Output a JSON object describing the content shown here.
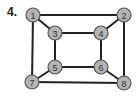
{
  "problem": {
    "label": "4."
  },
  "graph": {
    "node_radius": 7,
    "colors": {
      "node_fill": "#b4b4b4",
      "node_stroke": "#555555",
      "edge": "#222222",
      "label": "#333333"
    },
    "nodes": [
      {
        "id": "1",
        "label": "1",
        "x": 33,
        "y": 15
      },
      {
        "id": "2",
        "label": "2",
        "x": 124,
        "y": 15
      },
      {
        "id": "3",
        "label": "3",
        "x": 55,
        "y": 33
      },
      {
        "id": "4",
        "label": "4",
        "x": 101,
        "y": 33
      },
      {
        "id": "5",
        "label": "5",
        "x": 55,
        "y": 67
      },
      {
        "id": "6",
        "label": "6",
        "x": 101,
        "y": 67
      },
      {
        "id": "7",
        "label": "7",
        "x": 32,
        "y": 82
      },
      {
        "id": "8",
        "label": "8",
        "x": 124,
        "y": 83
      }
    ],
    "edges": [
      [
        "1",
        "2"
      ],
      [
        "1",
        "3"
      ],
      [
        "1",
        "7"
      ],
      [
        "2",
        "4"
      ],
      [
        "2",
        "8"
      ],
      [
        "3",
        "4"
      ],
      [
        "3",
        "5"
      ],
      [
        "4",
        "6"
      ],
      [
        "5",
        "6"
      ],
      [
        "5",
        "7"
      ],
      [
        "6",
        "8"
      ],
      [
        "7",
        "8"
      ]
    ]
  }
}
